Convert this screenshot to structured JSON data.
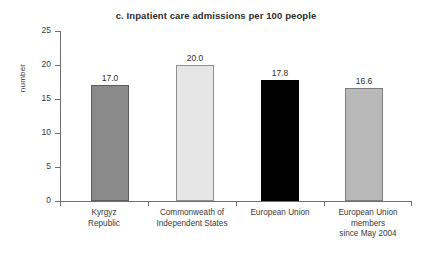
{
  "chart_data": {
    "type": "bar",
    "title": "c. Inpatient care admissions per 100 people",
    "xlabel": "",
    "ylabel": "number",
    "ylim": [
      0,
      25
    ],
    "yticks": [
      0,
      5,
      10,
      15,
      20,
      25
    ],
    "ytick_labels": [
      "0",
      "5",
      "10",
      "15",
      "20",
      "25"
    ],
    "grid": false,
    "legend": "none",
    "categories": [
      "Kyrgyz\nRepublic",
      "Commonweath of\nIndependent States",
      "European Union",
      "European Union\nmembers\nsince May 2004"
    ],
    "values": [
      17.0,
      20.0,
      17.8,
      16.6
    ],
    "value_labels": [
      "17.0",
      "20.0",
      "17.8",
      "16.6"
    ],
    "bar_colors": [
      "#8a8a8a",
      "#e6e6e6",
      "#000000",
      "#b9b9b9"
    ],
    "bar_edge_colors": [
      "#5d5d5d",
      "#8f8f8f",
      "#000000",
      "#7d7d7d"
    ]
  },
  "axis": {
    "spine_color": "#6f6f6f"
  }
}
